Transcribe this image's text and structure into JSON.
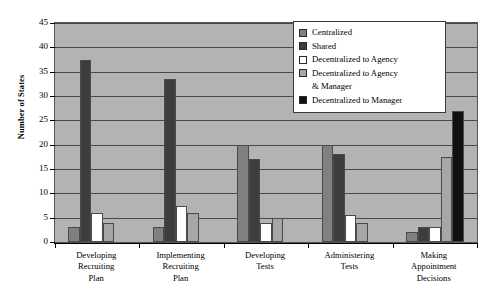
{
  "chart_data": {
    "type": "bar",
    "title": "",
    "xlabel": "",
    "ylabel": "Number of States",
    "ylim": [
      0,
      45
    ],
    "ytick_step": 5,
    "yticks": [
      0,
      5,
      10,
      15,
      20,
      25,
      30,
      35,
      40,
      45
    ],
    "grid": true,
    "legend_position": "top-right",
    "plot_background": "#b3b3b3",
    "categories": [
      "Developing Recruiting Plan",
      "Implementing Recruiting Plan",
      "Developing Tests",
      "Administering Tests",
      "Making Appointment Decisions"
    ],
    "category_label_lines": [
      [
        "Developing",
        "Recruiting",
        "Plan"
      ],
      [
        "Implementing",
        "Recruiting",
        "Plan"
      ],
      [
        "Developing",
        "Tests"
      ],
      [
        "Administering",
        "Tests"
      ],
      [
        "Making",
        "Appointment",
        "Decisions"
      ]
    ],
    "series": [
      {
        "name": "Centralized",
        "color": "#808080",
        "values": [
          3,
          3,
          20,
          20,
          2
        ]
      },
      {
        "name": "Shared",
        "color": "#3d3d3d",
        "values": [
          37.5,
          33.5,
          17,
          18,
          3
        ]
      },
      {
        "name": "Decentralized to Agency",
        "color": "#ffffff",
        "values": [
          6,
          7.5,
          4,
          5.5,
          3
        ]
      },
      {
        "name": "Decentralized to Agency & Manager",
        "color": "#a6a6a6",
        "values": [
          4,
          6,
          5,
          4,
          17.5
        ]
      },
      {
        "name": "Decentralized to Manager",
        "color": "#111111",
        "values": [
          0,
          0,
          0,
          0,
          27
        ]
      }
    ]
  },
  "legend": {
    "entries": [
      {
        "label": "Centralized",
        "continuation": ""
      },
      {
        "label": "Shared",
        "continuation": ""
      },
      {
        "label": "Decentralized to Agency",
        "continuation": ""
      },
      {
        "label": "Decentralized to Agency",
        "continuation": "& Manager"
      },
      {
        "label": "Decentralized to Manager",
        "continuation": ""
      }
    ]
  }
}
